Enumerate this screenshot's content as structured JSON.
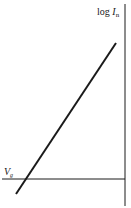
{
  "diagram": {
    "y_axis_label": {
      "base": "log ",
      "var": "I",
      "sub": "n"
    },
    "threshold_label": {
      "var": "V",
      "sub": "g"
    },
    "colors": {
      "ink": "#1a1a1a",
      "background": "#ffffff"
    },
    "elements": {
      "vertical_axis": {
        "x": 125,
        "y1": 4,
        "y2": 206
      },
      "horizontal_line": {
        "y": 179,
        "x1": 2,
        "x2": 125
      },
      "diagonal_line": {
        "x1": 116,
        "y1": 43,
        "x2": 16,
        "y2": 194
      }
    }
  }
}
